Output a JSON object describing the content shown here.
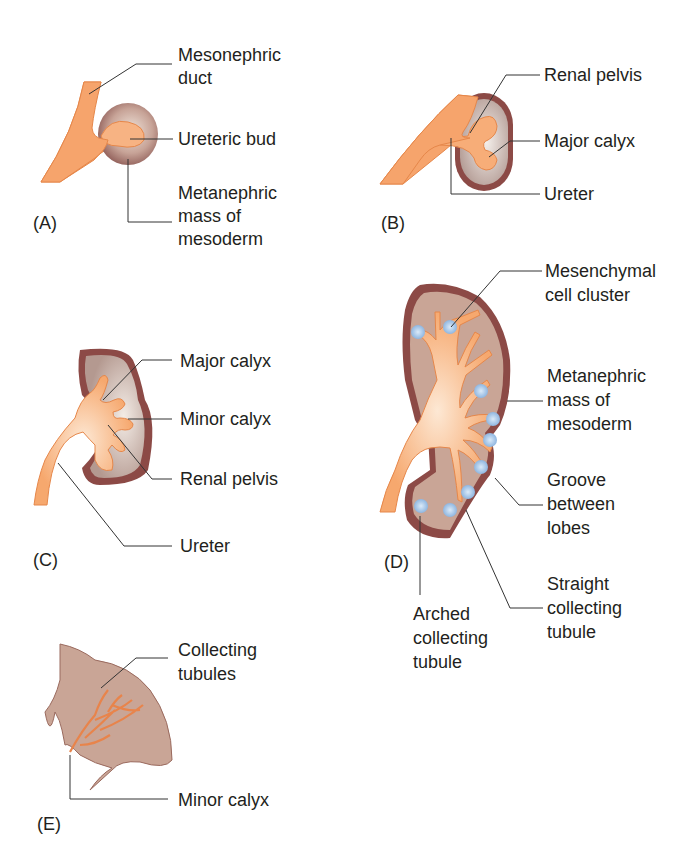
{
  "figure": {
    "panels": {
      "A": {
        "tag": "(A)",
        "labels": [
          "Mesonephric",
          "duct",
          "Ureteric bud",
          "Metanephric",
          "mass of",
          "mesoderm"
        ]
      },
      "B": {
        "tag": "(B)",
        "labels": [
          "Renal pelvis",
          "Major calyx",
          "Ureter"
        ]
      },
      "C": {
        "tag": "(C)",
        "labels": [
          "Major calyx",
          "Minor calyx",
          "Renal pelvis",
          "Ureter"
        ]
      },
      "D": {
        "tag": "(D)",
        "labels": [
          "Mesenchymal",
          "cell cluster",
          "Metanephric",
          "mass of",
          "mesoderm",
          "Groove",
          "between",
          "lobes",
          "Straight",
          "collecting",
          "tubule",
          "Arched",
          "collecting",
          "tubule"
        ]
      },
      "E": {
        "tag": "(E)",
        "labels": [
          "Collecting",
          "tubules",
          "Minor calyx"
        ]
      }
    },
    "colors": {
      "duct": "#f4a46a",
      "duct_light": "#fbd9b8",
      "capsule": "#8c4a46",
      "mesoderm": "#c9a496",
      "cells": "#a8c8ea",
      "leader": "#333333"
    }
  }
}
